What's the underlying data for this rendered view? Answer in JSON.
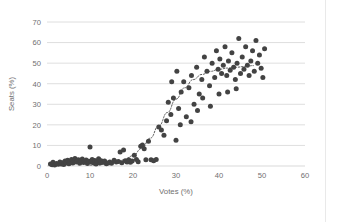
{
  "chart_data": {
    "type": "scatter",
    "title": "",
    "xlabel": "Votes (%)",
    "ylabel": "Seats (%)",
    "xlim": [
      0,
      60
    ],
    "ylim": [
      0,
      70
    ],
    "xticks": [
      0,
      10,
      20,
      30,
      40,
      50,
      60
    ],
    "yticks": [
      0,
      10,
      20,
      30,
      40,
      50,
      60,
      70
    ],
    "grid": "horizontal",
    "legend": "none",
    "marker_color": "#434343",
    "gridline_color": "#d6d6d6",
    "axis_text_color": "#6f6f6f",
    "background_color": "#ffffff",
    "series": [
      {
        "name": "Votes vs Seats",
        "marker": "circle",
        "points": [
          [
            0.8,
            1.0
          ],
          [
            1.2,
            0.6
          ],
          [
            1.4,
            1.8
          ],
          [
            1.8,
            0.5
          ],
          [
            2.2,
            1.2
          ],
          [
            2.6,
            0.8
          ],
          [
            3.0,
            2.0
          ],
          [
            3.3,
            1.0
          ],
          [
            3.6,
            1.6
          ],
          [
            3.9,
            0.7
          ],
          [
            4.2,
            2.4
          ],
          [
            4.5,
            1.4
          ],
          [
            4.8,
            2.8
          ],
          [
            5.1,
            1.1
          ],
          [
            5.4,
            2.0
          ],
          [
            5.7,
            3.2
          ],
          [
            6.0,
            1.5
          ],
          [
            6.2,
            2.6
          ],
          [
            6.5,
            3.6
          ],
          [
            6.8,
            1.9
          ],
          [
            7.0,
            2.2
          ],
          [
            7.3,
            3.0
          ],
          [
            7.6,
            1.3
          ],
          [
            7.9,
            2.5
          ],
          [
            8.2,
            3.4
          ],
          [
            8.5,
            1.7
          ],
          [
            8.8,
            2.1
          ],
          [
            9.1,
            2.9
          ],
          [
            9.4,
            1.2
          ],
          [
            9.7,
            2.3
          ],
          [
            10.0,
            9.2
          ],
          [
            10.2,
            2.0
          ],
          [
            10.5,
            3.1
          ],
          [
            10.8,
            1.6
          ],
          [
            11.1,
            2.7
          ],
          [
            11.4,
            1.0
          ],
          [
            11.7,
            2.2
          ],
          [
            12.0,
            3.5
          ],
          [
            12.3,
            1.4
          ],
          [
            12.6,
            2.6
          ],
          [
            13.0,
            1.8
          ],
          [
            13.4,
            2.4
          ],
          [
            13.8,
            1.1
          ],
          [
            14.2,
            1.5
          ],
          [
            14.6,
            2.0
          ],
          [
            15.0,
            1.3
          ],
          [
            15.6,
            2.8
          ],
          [
            16.1,
            1.9
          ],
          [
            16.6,
            2.2
          ],
          [
            17.0,
            6.8
          ],
          [
            17.4,
            1.6
          ],
          [
            17.8,
            7.8
          ],
          [
            18.2,
            2.5
          ],
          [
            18.6,
            2.0
          ],
          [
            19.0,
            3.0
          ],
          [
            19.4,
            1.8
          ],
          [
            19.8,
            2.4
          ],
          [
            20.3,
            5.2
          ],
          [
            20.8,
            3.2
          ],
          [
            21.2,
            2.1
          ],
          [
            21.8,
            9.6
          ],
          [
            22.2,
            10.2
          ],
          [
            22.6,
            8.4
          ],
          [
            23.0,
            3.0
          ],
          [
            23.6,
            12.0
          ],
          [
            24.2,
            3.0
          ],
          [
            24.8,
            2.6
          ],
          [
            25.4,
            3.2
          ],
          [
            26.0,
            19.0
          ],
          [
            26.6,
            17.5
          ],
          [
            27.2,
            15.0
          ],
          [
            27.8,
            22.0
          ],
          [
            28.2,
            31.0
          ],
          [
            28.8,
            25.0
          ],
          [
            29.4,
            33.0
          ],
          [
            30.0,
            12.5
          ],
          [
            30.6,
            28.0
          ],
          [
            31.2,
            36.0
          ],
          [
            31.8,
            41.0
          ],
          [
            32.4,
            24.0
          ],
          [
            33.0,
            38.0
          ],
          [
            33.6,
            44.0
          ],
          [
            34.2,
            30.0
          ],
          [
            34.8,
            48.0
          ],
          [
            35.4,
            35.0
          ],
          [
            36.0,
            42.0
          ],
          [
            36.6,
            53.0
          ],
          [
            37.2,
            46.0
          ],
          [
            37.8,
            39.0
          ],
          [
            38.4,
            50.0
          ],
          [
            39.0,
            43.0
          ],
          [
            39.4,
            56.0
          ],
          [
            39.8,
            47.0
          ],
          [
            40.2,
            52.0
          ],
          [
            40.6,
            45.0
          ],
          [
            41.0,
            49.0
          ],
          [
            41.4,
            58.0
          ],
          [
            41.8,
            44.0
          ],
          [
            42.2,
            51.0
          ],
          [
            42.6,
            46.5
          ],
          [
            43.0,
            55.0
          ],
          [
            43.4,
            48.0
          ],
          [
            43.8,
            42.0
          ],
          [
            44.2,
            50.0
          ],
          [
            44.6,
            62.0
          ],
          [
            45.0,
            45.0
          ],
          [
            45.4,
            53.0
          ],
          [
            45.8,
            47.0
          ],
          [
            46.2,
            58.0
          ],
          [
            46.6,
            49.0
          ],
          [
            47.0,
            44.0
          ],
          [
            47.4,
            51.0
          ],
          [
            47.8,
            56.0
          ],
          [
            48.2,
            46.0
          ],
          [
            48.6,
            61.0
          ],
          [
            49.0,
            50.0
          ],
          [
            49.4,
            54.0
          ],
          [
            49.8,
            47.5
          ],
          [
            50.2,
            43.0
          ],
          [
            50.6,
            57.0
          ],
          [
            35.0,
            27.0
          ],
          [
            36.2,
            33.0
          ],
          [
            38.0,
            29.0
          ],
          [
            40.0,
            35.0
          ],
          [
            42.0,
            36.0
          ],
          [
            44.0,
            37.5
          ],
          [
            29.0,
            41.0
          ],
          [
            31.0,
            20.0
          ],
          [
            33.5,
            21.5
          ],
          [
            30.2,
            46.0
          ]
        ]
      }
    ],
    "trendline": {
      "style": "dotted",
      "color": "#5a5a5a",
      "points": [
        [
          10.0,
          0.4
        ],
        [
          12.0,
          0.6
        ],
        [
          14.0,
          1.0
        ],
        [
          16.0,
          1.8
        ],
        [
          18.0,
          3.0
        ],
        [
          20.0,
          5.0
        ],
        [
          22.0,
          8.5
        ],
        [
          24.0,
          13.5
        ],
        [
          26.0,
          19.5
        ],
        [
          28.0,
          26.0
        ],
        [
          30.0,
          32.5
        ],
        [
          32.0,
          38.0
        ],
        [
          34.0,
          42.0
        ],
        [
          36.0,
          44.5
        ],
        [
          38.0,
          46.0
        ],
        [
          40.0,
          47.0
        ],
        [
          42.0,
          47.6
        ],
        [
          44.0,
          48.0
        ],
        [
          46.0,
          48.4
        ],
        [
          48.0,
          48.8
        ]
      ]
    }
  },
  "geometry": {
    "plot_left": 47,
    "plot_right": 305,
    "plot_top": 22,
    "plot_bottom": 166
  }
}
